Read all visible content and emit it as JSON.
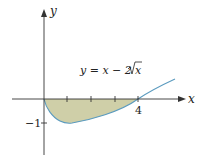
{
  "diagram": {
    "equation": "y = x − 2√x",
    "equation_parts": {
      "lhs": "y = x − 2",
      "radicand": "x"
    },
    "axes": {
      "x_label": "x",
      "y_label": "y"
    },
    "ticks": {
      "x_tick_label": "4",
      "y_tick_label": "−1"
    },
    "colors": {
      "fill": "#c9c9a0",
      "curve": "#5b9bbf",
      "axis": "#333333"
    }
  }
}
